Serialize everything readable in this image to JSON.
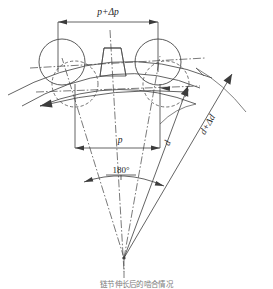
{
  "figure": {
    "type": "engineering-diagram",
    "background_color": "#ffffff",
    "line_color": "#3c3c3c",
    "text_color": "#1c1c1c",
    "caption": "链节伸长后的啮合情况"
  },
  "labels": {
    "pitch_extended": "p+Δp",
    "pitch_nominal": "p",
    "diameter_nominal": "d",
    "diameter_extended": "d+Δd",
    "angle": "180°"
  },
  "geometry": {
    "center_x": 124,
    "center_y": 258,
    "roller_radius": 22,
    "roller_left_solid": {
      "cx": 62,
      "cy": 62
    },
    "roller_right_solid": {
      "cx": 158,
      "cy": 62
    },
    "roller_left_dashed": {
      "cx": 75,
      "cy": 84
    },
    "roller_right_dashed": {
      "cx": 166,
      "cy": 84
    },
    "pitch_line_top_y": 22,
    "pitch_line_top_x1": 58,
    "pitch_line_top_x2": 158,
    "pitch_line_bottom_y": 148,
    "pitch_line_bottom_x1": 75,
    "pitch_line_bottom_x2": 160,
    "angle_arc_radius": 92,
    "outer_arc_radius": 205,
    "mid_arc_radius": 178
  },
  "dimensions": {
    "width": 273,
    "height": 289
  }
}
